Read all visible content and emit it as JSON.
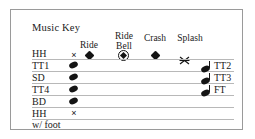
{
  "title": "Music Key",
  "colors": {
    "frame_border": "#9a9a9a",
    "staff_line": "#b8b8b8",
    "ink": "#141414",
    "background": "#ffffff"
  },
  "column_headers": [
    {
      "id": "ride",
      "label": "Ride",
      "symbol": "filled-diamond"
    },
    {
      "id": "ride_bell",
      "label": "Ride\nBell",
      "line1": "Ride",
      "line2": "Bell",
      "symbol": "circled-diamond"
    },
    {
      "id": "crash",
      "label": "Crash",
      "symbol": "filled-diamond"
    },
    {
      "id": "splash",
      "label": "Splash",
      "symbol": "crossed-x"
    }
  ],
  "rows": [
    {
      "id": "hh",
      "left_label": "HH",
      "right_label": "",
      "left_note": "x"
    },
    {
      "id": "tt1",
      "left_label": "TT1",
      "right_label": "TT2",
      "left_note": "oval",
      "right_note": "oval"
    },
    {
      "id": "sd",
      "left_label": "SD",
      "right_label": "TT3",
      "left_note": "oval",
      "right_note": "oval"
    },
    {
      "id": "tt4",
      "left_label": "TT4",
      "right_label": "FT",
      "left_note": "oval",
      "right_note": "oval"
    },
    {
      "id": "bd",
      "left_label": "BD",
      "right_label": "",
      "left_note": "oval"
    },
    {
      "id": "hh_foot",
      "left_label": "HH",
      "left_label2": "w/ foot",
      "right_label": "",
      "left_note": "x"
    }
  ],
  "legend_symbols": {
    "hh_x": "×",
    "hh_foot_x": "×"
  }
}
